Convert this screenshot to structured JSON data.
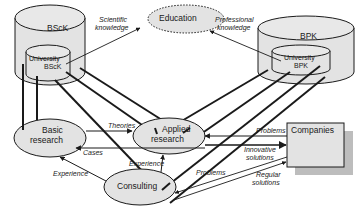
{
  "diagram": {
    "nodes": {
      "bsck": {
        "label": "BScK",
        "inner_label_1": "University",
        "inner_label_2": "BScK"
      },
      "bpk": {
        "label": "BPK",
        "inner_label_1": "University",
        "inner_label_2": "BPK"
      },
      "education": {
        "label": "Education"
      },
      "basic_research": {
        "label_1": "Basic",
        "label_2": "research"
      },
      "applied_research": {
        "label_1": "Applied",
        "label_2": "research"
      },
      "consulting": {
        "label": "Consulting"
      },
      "companies": {
        "label": "Companies"
      }
    },
    "edges": {
      "scientific_knowledge": {
        "label_1": "Scientific",
        "label_2": "knowledge"
      },
      "professional_knowledge": {
        "label_1": "Professional",
        "label_2": "knowledge"
      },
      "theories": {
        "label": "Theories"
      },
      "cases": {
        "label": "Cases"
      },
      "experience_consulting_basic": {
        "label": "Experience"
      },
      "experience_consulting_applied": {
        "label": "Experience"
      },
      "problems_companies_applied": {
        "label": "Problems"
      },
      "innovative_solutions": {
        "label_1": "Innovative",
        "label_2": "solutions"
      },
      "problems_companies_consulting": {
        "label": "Problems"
      },
      "regular_solutions": {
        "label_1": "Regular",
        "label_2": "solutions"
      }
    },
    "colors": {
      "fill": "#e3e3e3",
      "stroke": "#1a1a1a",
      "shadow": "#bdbdbd",
      "background": "#ffffff"
    }
  }
}
